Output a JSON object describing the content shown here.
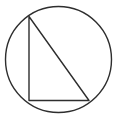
{
  "figure": {
    "background_color": "#ffffff",
    "stroke_color": "#2e2e2e",
    "stroke_width": 1.4,
    "canvas": {
      "width": 118,
      "height": 119
    },
    "shapes": {
      "circle": {
        "name": "circumscribed-circle",
        "cx": 58.5,
        "cy": 59.5,
        "r": 53.0,
        "filled": false
      },
      "triangle": {
        "name": "inscribed-right-triangle",
        "filled": false,
        "points": "29,16.5 29,100.5 89,100.5",
        "vertices": [
          {
            "label": "apex",
            "x": 29,
            "y": 16.5
          },
          {
            "label": "right-angle",
            "x": 29,
            "y": 100.5
          },
          {
            "label": "base-right",
            "x": 89,
            "y": 100.5
          }
        ],
        "edges": [
          {
            "name": "vertical-leg",
            "from": "apex",
            "to": "right-angle"
          },
          {
            "name": "horizontal-base",
            "from": "right-angle",
            "to": "base-right"
          },
          {
            "name": "hypotenuse",
            "from": "base-right",
            "to": "apex"
          }
        ]
      }
    },
    "labels": []
  }
}
